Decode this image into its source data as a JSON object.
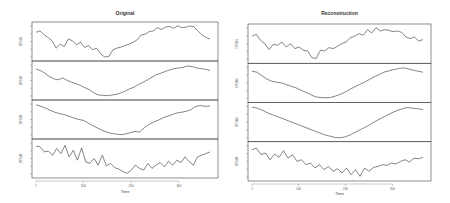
{
  "chart_data": [
    {
      "type": "line",
      "title": "Original",
      "xlabel": "Time",
      "x_ticks": [
        "1",
        "100",
        "200",
        "300"
      ],
      "xlim": [
        1,
        365
      ],
      "layout": "4 stacked panels sharing x-axis",
      "series": [
        {
          "name": "DF101",
          "values": [
            0.78,
            0.82,
            0.7,
            0.62,
            0.52,
            0.3,
            0.42,
            0.35,
            0.58,
            0.52,
            0.4,
            0.48,
            0.32,
            0.38,
            0.25,
            0.3,
            0.12,
            0.03,
            0.05,
            0.25,
            0.3,
            0.33,
            0.38,
            0.42,
            0.48,
            0.55,
            0.7,
            0.72,
            0.8,
            0.82,
            0.92,
            0.86,
            0.94,
            0.96,
            0.9,
            0.98,
            0.92,
            0.93,
            0.97,
            0.95,
            0.82,
            0.7,
            0.62,
            0.58
          ]
        },
        {
          "name": "DF102",
          "values": [
            0.85,
            0.8,
            0.72,
            0.62,
            0.55,
            0.52,
            0.58,
            0.5,
            0.45,
            0.4,
            0.35,
            0.28,
            0.22,
            0.12,
            0.06,
            0.05,
            0.04,
            0.06,
            0.08,
            0.12,
            0.18,
            0.25,
            0.3,
            0.38,
            0.45,
            0.52,
            0.6,
            0.68,
            0.72,
            0.78,
            0.82,
            0.86,
            0.88,
            0.9,
            0.94,
            0.92,
            0.88,
            0.86,
            0.84,
            0.8
          ]
        },
        {
          "name": "DF103",
          "values": [
            0.95,
            0.9,
            0.85,
            0.78,
            0.72,
            0.68,
            0.65,
            0.6,
            0.55,
            0.5,
            0.48,
            0.4,
            0.32,
            0.25,
            0.18,
            0.12,
            0.08,
            0.06,
            0.04,
            0.06,
            0.1,
            0.14,
            0.12,
            0.25,
            0.35,
            0.42,
            0.48,
            0.55,
            0.6,
            0.65,
            0.7,
            0.72,
            0.75,
            0.8,
            0.9,
            0.92,
            0.9,
            0.91
          ]
        },
        {
          "name": "DF104",
          "values": [
            0.88,
            0.85,
            0.7,
            0.72,
            0.6,
            0.8,
            0.65,
            0.9,
            0.55,
            0.75,
            0.45,
            0.82,
            0.4,
            0.35,
            0.5,
            0.3,
            0.6,
            0.28,
            0.35,
            0.22,
            0.18,
            0.1,
            0.05,
            0.15,
            0.3,
            0.2,
            0.15,
            0.35,
            0.2,
            0.3,
            0.38,
            0.25,
            0.42,
            0.3,
            0.45,
            0.38,
            0.55,
            0.4,
            0.3,
            0.55,
            0.6,
            0.65,
            0.7
          ]
        }
      ]
    },
    {
      "type": "line",
      "title": "Reconstruction",
      "xlabel": "Time",
      "x_ticks": [
        "1",
        "100",
        "200",
        "300"
      ],
      "xlim": [
        1,
        365
      ],
      "layout": "4 stacked panels sharing x-axis",
      "series": [
        {
          "name": "DF101",
          "values": [
            0.72,
            0.78,
            0.6,
            0.5,
            0.32,
            0.48,
            0.45,
            0.55,
            0.4,
            0.5,
            0.35,
            0.4,
            0.3,
            0.28,
            0.08,
            0.05,
            0.3,
            0.28,
            0.38,
            0.35,
            0.42,
            0.5,
            0.55,
            0.68,
            0.72,
            0.8,
            0.75,
            0.92,
            0.82,
            0.98,
            0.88,
            0.92,
            0.9,
            0.86,
            0.88,
            0.84,
            0.7,
            0.65,
            0.7,
            0.58,
            0.62
          ]
        },
        {
          "name": "DF102",
          "values": [
            0.85,
            0.82,
            0.72,
            0.62,
            0.55,
            0.52,
            0.5,
            0.45,
            0.4,
            0.35,
            0.28,
            0.22,
            0.15,
            0.08,
            0.06,
            0.05,
            0.06,
            0.1,
            0.15,
            0.22,
            0.3,
            0.38,
            0.45,
            0.52,
            0.6,
            0.68,
            0.75,
            0.82,
            0.86,
            0.9,
            0.93,
            0.95,
            0.92,
            0.88,
            0.85,
            0.82
          ]
        },
        {
          "name": "DF103",
          "values": [
            0.95,
            0.92,
            0.86,
            0.78,
            0.72,
            0.66,
            0.6,
            0.54,
            0.48,
            0.42,
            0.36,
            0.3,
            0.24,
            0.18,
            0.12,
            0.08,
            0.04,
            0.03,
            0.06,
            0.12,
            0.2,
            0.28,
            0.36,
            0.45,
            0.54,
            0.62,
            0.7,
            0.78,
            0.85,
            0.9,
            0.94,
            0.92,
            0.9,
            0.88
          ]
        },
        {
          "name": "DF104",
          "values": [
            0.85,
            0.9,
            0.7,
            0.75,
            0.55,
            0.72,
            0.62,
            0.82,
            0.6,
            0.7,
            0.5,
            0.55,
            0.4,
            0.45,
            0.3,
            0.4,
            0.25,
            0.35,
            0.2,
            0.28,
            0.15,
            0.3,
            0.1,
            0.25,
            0.05,
            0.3,
            0.2,
            0.32,
            0.35,
            0.4,
            0.38,
            0.45,
            0.42,
            0.5,
            0.55,
            0.48,
            0.6,
            0.58,
            0.62
          ]
        }
      ]
    }
  ],
  "charts": {
    "left": {
      "title": "Original",
      "xlabel": "Time",
      "panels": [
        "DF101",
        "DF102",
        "DF103",
        "DF104"
      ]
    },
    "right": {
      "title": "Reconstruction",
      "xlabel": "Time",
      "panels": [
        "DF101",
        "DF102",
        "DF103",
        "DF104"
      ]
    }
  },
  "style": {
    "line_color": "#333333",
    "frame_color": "#444444",
    "background": "#ffffff"
  }
}
